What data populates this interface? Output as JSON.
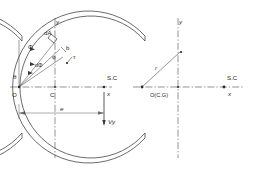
{
  "figure": {
    "type": "engineering-cross-section-diagram",
    "stroke_color": "#3a3a3a",
    "dash_color": "#4a4a4a",
    "background": "#ffffff",
    "width": 257,
    "height": 174
  },
  "left_diagram": {
    "name": "arc-section-with-angle-integration",
    "labels": {
      "y_axis": "y",
      "x_axis": "x",
      "origin": "O",
      "centroid": "C",
      "shear_center": "S.C",
      "area_element": "dA",
      "angle_phi": "Φ",
      "angle_dphi": "dΦ",
      "angle_phi_inner": "φ",
      "angle_theta": "θ",
      "thickness": "b",
      "shear_stress": "τ",
      "eccentricity": "e",
      "shear_force": "Vy"
    }
  },
  "right_diagram": {
    "name": "arc-section-with-radius",
    "labels": {
      "y_axis": "y",
      "x_axis": "x",
      "origin_cg": "O(C.G)",
      "shear_center": "S.C",
      "radius": "r"
    }
  }
}
